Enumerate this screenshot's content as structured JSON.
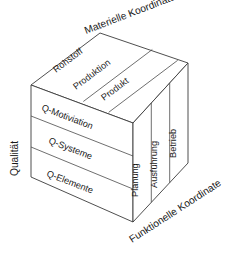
{
  "diagram": {
    "type": "3d-cube-model",
    "axes": {
      "top": {
        "name": "materielle-koordinate",
        "label": "Materielle Koordinate"
      },
      "left": {
        "name": "qualitaet",
        "label": "Qualität"
      },
      "bottom_right": {
        "name": "funktionelle-koordinate",
        "label": "Funktionelle Koordinate"
      }
    },
    "top_face": {
      "name": "materielle-achse-segmente",
      "cells": [
        {
          "label": "Rohstoff"
        },
        {
          "label": "Produktion"
        },
        {
          "label": "Produkt"
        }
      ]
    },
    "front_face": {
      "name": "qualitaets-achse-segmente",
      "cells": [
        {
          "label": "Q-Motiviation"
        },
        {
          "label": "Q-Systeme"
        },
        {
          "label": "Q-Elemente"
        }
      ]
    },
    "right_face": {
      "name": "funktionelle-achse-segmente",
      "cells": [
        {
          "label": "Planung"
        },
        {
          "label": "Ausführung"
        },
        {
          "label": "Betrieb"
        }
      ]
    },
    "colors": {
      "background": "#ffffff",
      "stroke": "#3b3b3b",
      "text": "#1a1a1a"
    }
  }
}
